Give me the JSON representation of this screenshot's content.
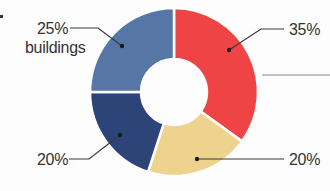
{
  "chart_data": {
    "type": "pie",
    "subtype": "donut",
    "title": "",
    "unit": "%",
    "categories": [
      "",
      "",
      "",
      "buildings"
    ],
    "values": [
      35,
      20,
      20,
      25
    ],
    "segments": [
      {
        "label": "35%",
        "category": "",
        "value": 35,
        "color": "#ee4446"
      },
      {
        "label": "20%",
        "category": "",
        "value": 20,
        "color": "#eed38e"
      },
      {
        "label": "20%",
        "category": "",
        "value": 20,
        "color": "#2d4479"
      },
      {
        "label": "25%",
        "category": "buildings",
        "value": 25,
        "color": "#5677a6"
      }
    ],
    "start_angle_deg": 0,
    "direction": "clockwise",
    "legend": "none",
    "labels_position": "outside-with-leader-lines"
  },
  "labels": {
    "top_left_value": "25%",
    "top_left_category": "buildings",
    "top_right_value": "35%",
    "bottom_left_value": "20%",
    "bottom_right_value": "20%"
  },
  "colors": {
    "red": "#ee4446",
    "tan": "#eed38e",
    "navy": "#2d4479",
    "steel_blue": "#5677a6",
    "leader_line": "#3a3a3a",
    "text": "#333333",
    "background": "#fdfdfd"
  }
}
